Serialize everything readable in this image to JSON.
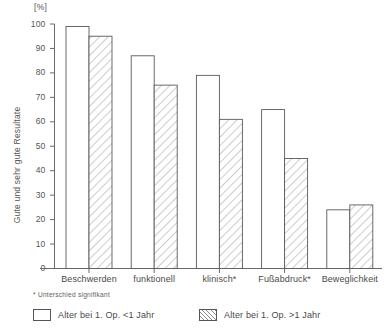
{
  "chart_data": {
    "type": "bar",
    "title": "",
    "subtitle": "",
    "unit_label": "[%]",
    "ylabel": "Gute und sehr gute Resultate",
    "xlabel": "",
    "ylim": [
      0,
      100
    ],
    "ytick_values": [
      0,
      10,
      20,
      30,
      40,
      50,
      60,
      70,
      80,
      90,
      100
    ],
    "ytick_labels": [
      "0",
      "10",
      "20",
      "30",
      "40",
      "50",
      "60",
      "70",
      "80",
      "90",
      "100"
    ],
    "grid": false,
    "legend_position": "below-axes",
    "categories": [
      "Beschwerden",
      "funktionell",
      "klinisch*",
      "Fußabdruck*",
      "Beweglichkeit"
    ],
    "series": [
      {
        "name": "Alter bei 1. Op. <1 Jahr",
        "style": "open",
        "values": [
          99,
          87,
          79,
          65,
          24
        ]
      },
      {
        "name": "Alter bei 1. Op. >1 Jahr",
        "style": "hatched",
        "values": [
          95,
          75,
          61,
          45,
          26
        ]
      }
    ],
    "annotations": [
      "* Unterschied signifikant"
    ]
  },
  "axes": {
    "unit_label": "[%]",
    "ylabel": "Gute und sehr gute Resultate",
    "yticks": [
      "100",
      "90",
      "80",
      "70",
      "60",
      "50",
      "40",
      "30",
      "20",
      "10",
      "0"
    ],
    "categories": [
      {
        "label": "Beschwerden",
        "significant": false
      },
      {
        "label": "funktionell",
        "significant": false
      },
      {
        "label": "klinisch*",
        "significant": true
      },
      {
        "label": "Fußabdruck*",
        "significant": true
      },
      {
        "label": "Beweglichkeit",
        "significant": false
      }
    ]
  },
  "footnote": {
    "text": "* Unterschied signifikant"
  },
  "legend": {
    "items": [
      {
        "label": "Alter bei 1. Op. <1 Jahr",
        "style": "open"
      },
      {
        "label": "Alter bei 1. Op. >1 Jahr",
        "style": "hatched"
      }
    ]
  },
  "colors": {
    "axis": "#6a6a6a",
    "bar_outline": "#5a5a5a",
    "bar_fill": "#ffffff",
    "hatch": "#8e8e8e",
    "text": "#4a4a4a"
  }
}
